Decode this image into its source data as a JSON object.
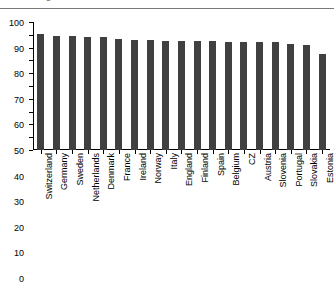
{
  "title_clipped": "diagnosed level 1",
  "chart_data": {
    "type": "bar",
    "title": "diagnosed level 1",
    "xlabel": "",
    "ylabel": "",
    "ylim": [
      0,
      100
    ],
    "yticks": [
      0,
      10,
      20,
      30,
      40,
      50,
      60,
      70,
      80,
      90,
      100
    ],
    "grid": false,
    "legend": null,
    "bar_color": "#404040",
    "categories": [
      "Switzerland",
      "Germany",
      "Sweden",
      "Netherlands",
      "Denmark",
      "France",
      "Ireland",
      "Norway",
      "Italy",
      "England",
      "Finland",
      "Spain",
      "Belgium",
      "CZ",
      "Austria",
      "Slovenia",
      "Portugal",
      "Slovakia",
      "Estonia"
    ],
    "values": [
      91,
      89,
      89,
      88,
      88,
      87,
      86,
      86,
      85,
      85,
      85,
      85,
      84,
      84,
      84,
      84,
      83,
      82,
      75
    ]
  }
}
